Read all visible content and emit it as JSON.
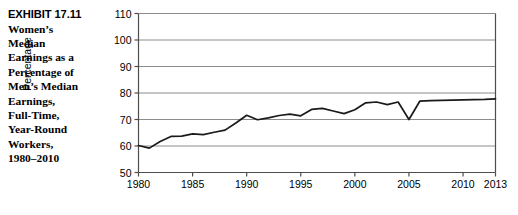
{
  "caption": {
    "exhibit_number": "EXHIBIT 17.11",
    "description_lines": [
      "Women’s",
      "Median",
      "Earnings as a",
      "Percentage of",
      "Men’s Median",
      "Earnings,",
      "Full-Time,",
      "Year-Round",
      "Workers,",
      "1980–2010"
    ]
  },
  "chart_data": {
    "type": "line",
    "title": "",
    "xlabel": "",
    "ylabel": "Percentage",
    "xlim": [
      1980,
      2013
    ],
    "ylim": [
      50,
      110
    ],
    "ytick_values": [
      50,
      60,
      70,
      80,
      90,
      100,
      110
    ],
    "ytick_labels": [
      "50",
      "60",
      "70",
      "80",
      "90",
      "100",
      "110"
    ],
    "xtick_values": [
      1980,
      1985,
      1990,
      1995,
      2000,
      2005,
      2010,
      2013
    ],
    "xtick_labels": [
      "1980",
      "1985",
      "1990",
      "1995",
      "2000",
      "2005",
      "2010",
      "2013"
    ],
    "grid": "horizontal",
    "legend": "none",
    "line_color": "#1a1a1a",
    "grid_color": "#8c8c8c",
    "axis_color": "#4d4d4d",
    "x": [
      1980,
      1981,
      1982,
      1983,
      1984,
      1985,
      1986,
      1987,
      1988,
      1989,
      1990,
      1991,
      1992,
      1993,
      1994,
      1995,
      1996,
      1997,
      1998,
      1999,
      2000,
      2001,
      2002,
      2003,
      2004,
      2005,
      2006,
      2007,
      2008,
      2009,
      2010,
      2011,
      2012,
      2013
    ],
    "values": [
      60.2,
      59.2,
      61.7,
      63.6,
      63.7,
      64.6,
      64.3,
      65.2,
      66.0,
      68.7,
      71.6,
      69.9,
      70.6,
      71.5,
      72.0,
      71.4,
      73.8,
      74.2,
      73.2,
      72.2,
      73.7,
      76.3,
      76.6,
      75.6,
      76.6,
      70.0,
      76.9,
      77.1,
      77.2,
      77.3,
      77.4,
      77.5,
      77.6,
      77.8
    ],
    "annotations": []
  }
}
